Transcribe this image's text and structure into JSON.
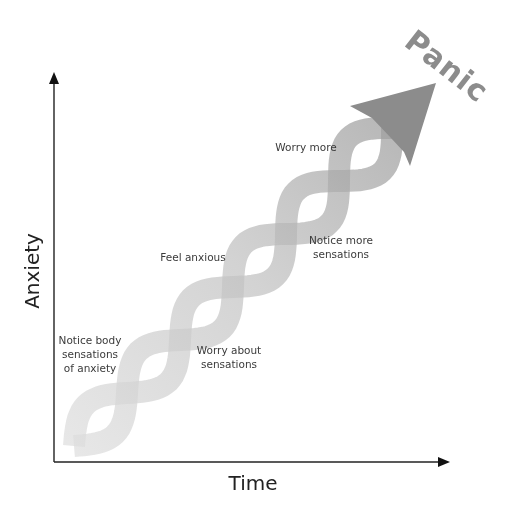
{
  "diagram": {
    "title": "Panic",
    "axes": {
      "x_label": "Time",
      "y_label": "Anxiety"
    },
    "labels": [
      {
        "id": "notice-body",
        "lines": [
          "Notice body",
          "sensations",
          "of anxiety"
        ]
      },
      {
        "id": "worry-about",
        "lines": [
          "Worry about",
          "sensations"
        ]
      },
      {
        "id": "feel-anxious",
        "lines": [
          "Feel anxious"
        ]
      },
      {
        "id": "notice-more",
        "lines": [
          "Notice more",
          "sensations"
        ]
      },
      {
        "id": "worry-more",
        "lines": [
          "Worry more"
        ]
      }
    ],
    "colors": {
      "strand_light": "#dcdcdc",
      "strand_dark": "#8f8f8f",
      "arrowhead": "#8a8a8a",
      "axis": "#222222",
      "text": "#3a3a3a"
    }
  }
}
